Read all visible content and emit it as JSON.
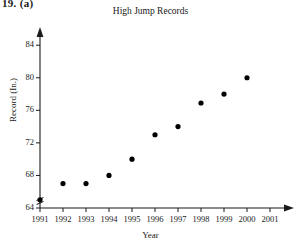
{
  "problem_label": "19. (a)",
  "axis_title_y": "Record (In.)",
  "axis_title_x": "Year",
  "chart_data": {
    "type": "scatter",
    "title": "High Jump Records",
    "xlabel": "Year",
    "ylabel": "Record (In.)",
    "xlim": [
      1991,
      2001
    ],
    "ylim": [
      64,
      85.5
    ],
    "grid": false,
    "legend": null,
    "axis_break_y": true,
    "xticks": [
      1991,
      1992,
      1993,
      1994,
      1995,
      1996,
      1997,
      1998,
      1999,
      2000,
      2001
    ],
    "xticklabels": [
      "1991",
      "1992",
      "1993",
      "1994",
      "1995",
      "1996",
      "1997",
      "1998",
      "1999",
      "2000",
      "2001"
    ],
    "yticks": [
      64,
      68,
      72,
      76,
      80,
      84
    ],
    "yticklabels": [
      "64",
      "68",
      "72",
      "76",
      "80",
      "84"
    ],
    "marker": "filled-circle",
    "marker_color": "#000000",
    "x": [
      1991,
      1992,
      1993,
      1994,
      1995,
      1996,
      1997,
      1998,
      1999,
      2000
    ],
    "y": [
      65,
      67,
      67,
      68,
      70,
      73,
      74,
      76.9,
      78,
      80
    ],
    "points": [
      {
        "year": "1991",
        "record": 65
      },
      {
        "year": "1992",
        "record": 67
      },
      {
        "year": "1993",
        "record": 67
      },
      {
        "year": "1994",
        "record": 68
      },
      {
        "year": "1995",
        "record": 70
      },
      {
        "year": "1996",
        "record": 73
      },
      {
        "year": "1997",
        "record": 74
      },
      {
        "year": "1998",
        "record": 76.9
      },
      {
        "year": "1999",
        "record": 78
      },
      {
        "year": "2000",
        "record": 80
      }
    ]
  }
}
